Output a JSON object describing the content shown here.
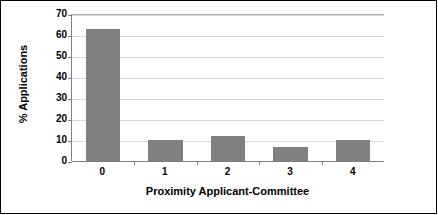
{
  "chart_data": {
    "type": "bar",
    "title": "",
    "categories": [
      "0",
      "1",
      "2",
      "3",
      "4"
    ],
    "values": [
      63,
      10,
      12,
      6.5,
      10
    ],
    "series": [
      {
        "name": "% Applications",
        "values": [
          63,
          10,
          12,
          6.5,
          10
        ]
      }
    ],
    "xlabel": "Proximity Applicant-Committee",
    "ylabel": "% Applications",
    "ylim": [
      0,
      70
    ],
    "yticks": [
      0,
      10,
      20,
      30,
      40,
      50,
      60,
      70
    ],
    "ytick_labels": [
      "0",
      "10",
      "20",
      "30",
      "40",
      "50",
      "60",
      "70"
    ],
    "grid": "horizontal",
    "legend": "none",
    "bar_color": "#808080",
    "gridline_color": "#D9D9D9",
    "axis_color": "#808080",
    "background_color": "#FFFFFF",
    "border_color": "#000000"
  }
}
